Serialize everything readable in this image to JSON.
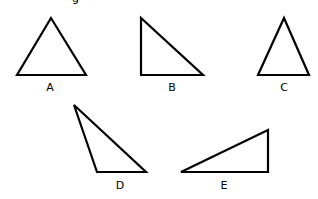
{
  "header_fragment": "g",
  "triangles": [
    {
      "label": "A",
      "type": "acute isosceles",
      "points": [
        [
          51,
          18
        ],
        [
          17,
          75
        ],
        [
          86,
          75
        ]
      ],
      "label_pos": [
        50,
        91
      ]
    },
    {
      "label": "B",
      "type": "right",
      "points": [
        [
          141,
          18
        ],
        [
          141,
          75
        ],
        [
          203,
          75
        ]
      ],
      "label_pos": [
        172,
        91
      ]
    },
    {
      "label": "C",
      "type": "acute isosceles",
      "points": [
        [
          284,
          18
        ],
        [
          258,
          75
        ],
        [
          309,
          75
        ]
      ],
      "label_pos": [
        284,
        91
      ]
    },
    {
      "label": "D",
      "type": "obtuse",
      "points": [
        [
          74,
          105
        ],
        [
          97,
          172
        ],
        [
          146,
          172
        ]
      ],
      "label_pos": [
        120,
        189
      ]
    },
    {
      "label": "E",
      "type": "right",
      "points": [
        [
          181,
          172
        ],
        [
          268,
          130
        ],
        [
          268,
          172
        ]
      ],
      "label_pos": [
        224,
        189
      ]
    }
  ],
  "style": {
    "stroke": "#000000",
    "background": "#ffffff"
  }
}
